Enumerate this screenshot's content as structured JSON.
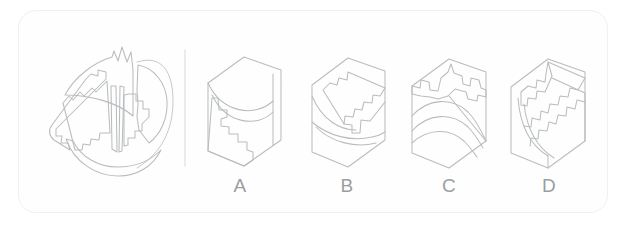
{
  "card": {
    "type": "spatial-reasoning-puzzle",
    "background_color": "#ffffff",
    "border_color": "#f0f0f0",
    "line_color": "#b9bcbe",
    "label_color": "#9b9ea0",
    "divider_color": "#e6e7e8"
  },
  "prompt": {
    "name": "exploded-assembly-figure",
    "description": "Circular disc exploded into wedge pieces with zigzag cut edges",
    "pieces": [
      "top-wedge-with-jagged-crown",
      "left-bar-with-stepped-edge",
      "center-vertical-sliver",
      "right-curved-wedge",
      "bottom-crescent-arc"
    ]
  },
  "divider": {
    "name": "vertical-divider",
    "x": 185,
    "y_top": 50,
    "y_bottom": 166
  },
  "options": [
    {
      "id": "A",
      "label": "A",
      "label_x": 240,
      "label_y": 192,
      "description": "Hexagonal cube, curved dome top face, stepped zigzag notch on left face"
    },
    {
      "id": "B",
      "label": "B",
      "label_x": 347,
      "label_y": 192,
      "description": "Hexagonal cube, diagonal zigzag band across top, curved arc on lower left face"
    },
    {
      "id": "C",
      "label": "C",
      "label_x": 449,
      "label_y": 192,
      "description": "Hexagonal cube, crown-like jagged ridge across top, broad curved arc on front faces"
    },
    {
      "id": "D",
      "label": "D",
      "label_x": 549,
      "label_y": 192,
      "description": "Hexagonal cube, stepped zigzag descending right, curved sweep on left face"
    }
  ]
}
